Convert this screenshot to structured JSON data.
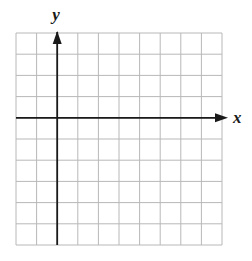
{
  "diagram": {
    "type": "coordinate-grid",
    "grid": {
      "columns": 10,
      "rows": 10,
      "left": 16,
      "top": 33,
      "right": 222,
      "bottom": 245,
      "line_color": "#b8b8b8"
    },
    "axes": {
      "origin_column": 2,
      "origin_row": 4,
      "color": "#1a1a1a",
      "x_label": "x",
      "y_label": "y"
    }
  }
}
